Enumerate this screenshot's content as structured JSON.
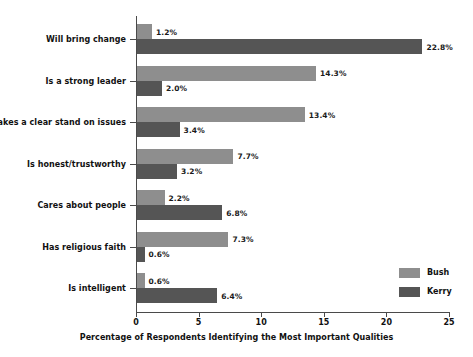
{
  "chart_data": {
    "type": "bar",
    "orientation": "horizontal",
    "title": "",
    "xlabel": "Percentage of Respondents Identifying the Most Important Qualities",
    "ylabel": "",
    "xlim": [
      0,
      25
    ],
    "xticks": [
      0,
      5,
      10,
      15,
      20,
      25
    ],
    "xtick_labels": [
      "0",
      "5",
      "10",
      "15",
      "20",
      "25"
    ],
    "grid": false,
    "legend_position": "lower-right",
    "categories": [
      "Will bring change",
      "Is a strong leader",
      "Takes a clear stand on issues",
      "Is honest/trustworthy",
      "Cares about people",
      "Has religious faith",
      "Is intelligent"
    ],
    "series": [
      {
        "name": "Bush",
        "color": "#8e8e8e",
        "values": [
          1.2,
          14.3,
          13.4,
          7.7,
          2.2,
          7.3,
          0.6
        ],
        "labels": [
          "1.2%",
          "14.3%",
          "13.4%",
          "7.7%",
          "2.2%",
          "7.3%",
          "0.6%"
        ]
      },
      {
        "name": "Kerry",
        "color": "#555555",
        "values": [
          22.8,
          2.0,
          3.4,
          3.2,
          6.8,
          0.6,
          6.4
        ],
        "labels": [
          "22.8%",
          "2.0%",
          "3.4%",
          "3.2%",
          "6.8%",
          "0.6%",
          "6.4%"
        ]
      }
    ],
    "legend": [
      {
        "label": "Bush",
        "color": "#8e8e8e"
      },
      {
        "label": "Kerry",
        "color": "#555555"
      }
    ]
  }
}
